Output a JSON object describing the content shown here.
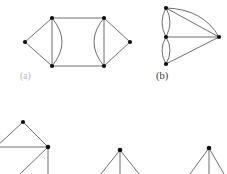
{
  "figure": {
    "type": "graph-theory-diagram",
    "background_color": "#ffffff",
    "edge_color": "#4a4a4a",
    "vertex_color": "#111111",
    "vertex_radius": 2.1,
    "edge_width": 0.8,
    "captions": [
      {
        "id": "a",
        "label": "(a)",
        "color": "#b9b9b9",
        "x": 20,
        "y": 72
      },
      {
        "id": "b",
        "label": "(b)",
        "color": "#3a3a3a",
        "x": 156,
        "y": 71
      }
    ],
    "graphs": [
      {
        "name": "graph-a",
        "caption": "(a)",
        "vertex_count": 6,
        "vertices": [
          {
            "id": "a-left",
            "x": 25,
            "y": 42
          },
          {
            "id": "a-top-left",
            "x": 52,
            "y": 18
          },
          {
            "id": "a-bottom-left",
            "x": 52,
            "y": 66
          },
          {
            "id": "a-top-right",
            "x": 104,
            "y": 18
          },
          {
            "id": "a-bottom-right",
            "x": 104,
            "y": 66
          },
          {
            "id": "a-right",
            "x": 130,
            "y": 42
          }
        ],
        "edges": [
          {
            "from": "a-left",
            "to": "a-top-left",
            "kind": "straight"
          },
          {
            "from": "a-left",
            "to": "a-bottom-left",
            "kind": "straight"
          },
          {
            "from": "a-top-left",
            "to": "a-bottom-left",
            "kind": "straight"
          },
          {
            "from": "a-top-left",
            "to": "a-bottom-left",
            "kind": "curved-right"
          },
          {
            "from": "a-top-left",
            "to": "a-top-right",
            "kind": "straight"
          },
          {
            "from": "a-bottom-left",
            "to": "a-bottom-right",
            "kind": "straight"
          },
          {
            "from": "a-top-right",
            "to": "a-bottom-right",
            "kind": "straight"
          },
          {
            "from": "a-top-right",
            "to": "a-bottom-right",
            "kind": "curved-left"
          },
          {
            "from": "a-top-right",
            "to": "a-right",
            "kind": "straight"
          },
          {
            "from": "a-bottom-right",
            "to": "a-right",
            "kind": "straight"
          }
        ]
      },
      {
        "name": "graph-b",
        "caption": "(b)",
        "vertex_count": 4,
        "vertices": [
          {
            "id": "b-top",
            "x": 166,
            "y": 8
          },
          {
            "id": "b-middle",
            "x": 166,
            "y": 37
          },
          {
            "id": "b-bottom",
            "x": 166,
            "y": 64
          },
          {
            "id": "b-right",
            "x": 219,
            "y": 37
          }
        ],
        "edges": [
          {
            "from": "b-top",
            "to": "b-middle",
            "kind": "curved-left"
          },
          {
            "from": "b-top",
            "to": "b-middle",
            "kind": "curved-right"
          },
          {
            "from": "b-middle",
            "to": "b-bottom",
            "kind": "curved-left"
          },
          {
            "from": "b-middle",
            "to": "b-bottom",
            "kind": "curved-right"
          },
          {
            "from": "b-top",
            "to": "b-right",
            "kind": "straight"
          },
          {
            "from": "b-top",
            "to": "b-right",
            "kind": "arc-over"
          },
          {
            "from": "b-middle",
            "to": "b-right",
            "kind": "straight"
          },
          {
            "from": "b-bottom",
            "to": "b-right",
            "kind": "straight"
          }
        ]
      },
      {
        "name": "graph-bottom-left",
        "caption": "",
        "cropped": true,
        "vertex_count": 2,
        "vertices": [
          {
            "id": "c-top",
            "x": 23,
            "y": 122
          },
          {
            "id": "c-right",
            "x": 48,
            "y": 147
          }
        ],
        "edges": [
          {
            "from": "c-top",
            "to": "c-right",
            "kind": "straight"
          },
          {
            "from": "c-top",
            "to": "off-left-upper",
            "kind": "straight"
          },
          {
            "from": "c-right",
            "to": "off-left-lower",
            "kind": "straight"
          },
          {
            "from": "c-right",
            "to": "off-left-mid",
            "kind": "straight"
          },
          {
            "from": "c-right",
            "to": "off-bottom",
            "kind": "straight"
          }
        ]
      },
      {
        "name": "graph-bottom-middle",
        "caption": "",
        "cropped": true,
        "vertex_count": 1,
        "vertices": [
          {
            "id": "d-apex",
            "x": 120,
            "y": 150
          }
        ],
        "edges": [
          {
            "from": "d-apex",
            "to": "off-bottom-left",
            "kind": "straight"
          },
          {
            "from": "d-apex",
            "to": "off-bottom-center",
            "kind": "straight"
          },
          {
            "from": "d-apex",
            "to": "off-bottom-right",
            "kind": "straight"
          }
        ]
      },
      {
        "name": "graph-bottom-right",
        "caption": "",
        "cropped": true,
        "vertex_count": 1,
        "vertices": [
          {
            "id": "e-apex",
            "x": 209,
            "y": 148
          }
        ],
        "edges": [
          {
            "from": "e-apex",
            "to": "off-bottom-left",
            "kind": "straight"
          },
          {
            "from": "e-apex",
            "to": "off-bottom-center",
            "kind": "straight"
          },
          {
            "from": "e-apex",
            "to": "off-bottom-right",
            "kind": "straight"
          }
        ]
      }
    ]
  }
}
